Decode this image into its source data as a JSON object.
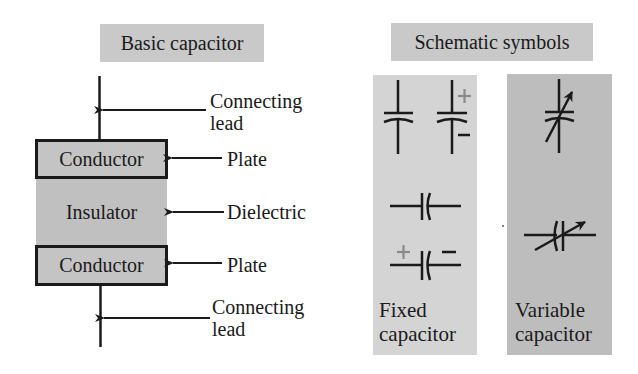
{
  "basic": {
    "title": "Basic capacitor",
    "top_conductor": "Conductor",
    "insulator": "Insulator",
    "bottom_conductor": "Conductor",
    "callouts": {
      "top_lead_line1": "Connecting",
      "top_lead_line2": "lead",
      "top_plate": "Plate",
      "dielectric": "Dielectric",
      "bottom_plate": "Plate",
      "bottom_lead_line1": "Connecting",
      "bottom_lead_line2": "lead"
    }
  },
  "schematic": {
    "title": "Schematic symbols",
    "fixed": {
      "label_line1": "Fixed",
      "label_line2": "capacitor",
      "polarity_plus": "+",
      "polarity_minus": "–"
    },
    "variable": {
      "label_line1": "Variable",
      "label_line2": "capacitor"
    }
  },
  "colors": {
    "title_bg": "#c9c9c9",
    "conductor_bg": "#c4c4c4",
    "insulator_bg": "#c0c0c0",
    "fixed_panel_bg": "#d4d4d4",
    "variable_panel_bg": "#bdbdbd",
    "ink": "#1a1a1a",
    "polarity_plus": "#8a8a8a"
  }
}
